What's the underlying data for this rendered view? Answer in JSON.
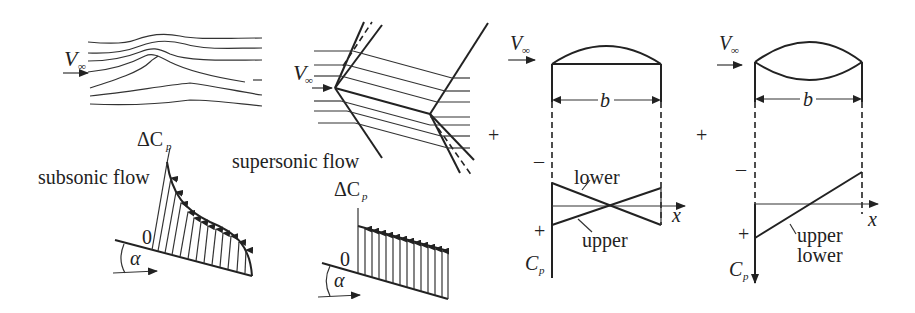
{
  "diagram": {
    "panel_subsonic": {
      "freestream_label": "V",
      "freestream_sub": "∞",
      "delta_cp_label": "ΔC",
      "delta_cp_sub": "p",
      "flow_label": "subsonic flow",
      "zero_label": "0",
      "angle_label": "α"
    },
    "panel_supersonic": {
      "freestream_label": "V",
      "freestream_sub": "∞",
      "delta_cp_label": "ΔC",
      "delta_cp_sub": "p",
      "flow_label": "supersonic flow",
      "zero_label": "0",
      "angle_label": "α"
    },
    "plus_1": "+",
    "panel_camber": {
      "freestream_label": "V",
      "freestream_sub": "∞",
      "chord_label": "b",
      "minus_label": "–",
      "plus_label": "+",
      "lower_label": "lower",
      "upper_label": "upper",
      "x_label": "x",
      "cp_label": "C",
      "cp_sub": "p"
    },
    "plus_2": "+",
    "panel_thickness": {
      "freestream_label": "V",
      "freestream_sub": "∞",
      "chord_label": "b",
      "minus_label": "–",
      "plus_label": "+",
      "upper_label": "upper",
      "lower_label": "lower",
      "x_label": "x",
      "cp_label": "C",
      "cp_sub": "p"
    }
  }
}
